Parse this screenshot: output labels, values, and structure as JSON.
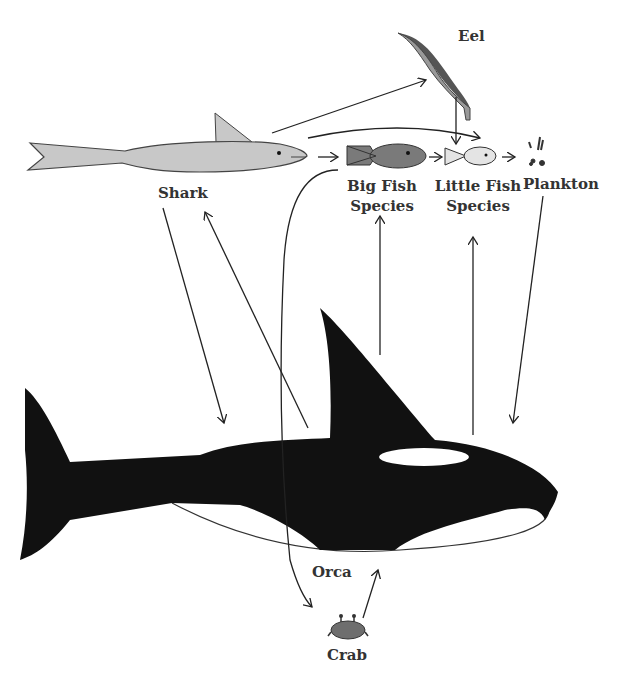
{
  "diagram": {
    "type": "food-web",
    "colors": {
      "orca": "#111111",
      "shark": "#c8c8c8",
      "big_fish": "#7a7a7a",
      "little_fish": "#e4e4e4",
      "eel_dark": "#555555",
      "eel_light": "#999999",
      "crab": "#6e6e6e",
      "arrow": "#222222",
      "text": "#333333"
    },
    "nodes": {
      "shark": {
        "label": "Shark"
      },
      "eel": {
        "label": "Eel"
      },
      "big_fish": {
        "line1": "Big Fish",
        "line2": "Species"
      },
      "little_fish": {
        "line1": "Little Fish",
        "line2": "Species"
      },
      "plankton": {
        "label": "Plankton"
      },
      "orca": {
        "label": "Orca"
      },
      "crab": {
        "label": "Crab"
      }
    },
    "edges": [
      {
        "from": "shark",
        "to": "eel"
      },
      {
        "from": "shark",
        "to": "little_fish"
      },
      {
        "from": "shark",
        "to": "big_fish"
      },
      {
        "from": "eel",
        "to": "little_fish"
      },
      {
        "from": "big_fish",
        "to": "little_fish"
      },
      {
        "from": "little_fish",
        "to": "plankton"
      },
      {
        "from": "shark",
        "to": "orca"
      },
      {
        "from": "orca",
        "to": "shark"
      },
      {
        "from": "orca",
        "to": "big_fish"
      },
      {
        "from": "orca",
        "to": "little_fish"
      },
      {
        "from": "plankton",
        "to": "orca"
      },
      {
        "from": "big_fish",
        "to": "crab"
      },
      {
        "from": "crab",
        "to": "orca"
      }
    ]
  }
}
